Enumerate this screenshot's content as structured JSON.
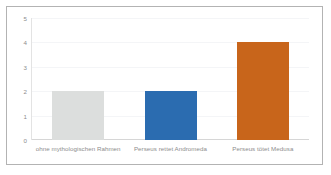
{
  "chart_data": {
    "type": "bar",
    "title": "",
    "subtitle": "",
    "xlabel": "",
    "ylabel": "",
    "categories": [
      "ohne mythologischen Rahmen",
      "Perseus rettet Andromeda",
      "Perseus tötet Medusa"
    ],
    "values": [
      2,
      2,
      4
    ],
    "bar_colors": [
      "#dcdedd",
      "#2b6cb0",
      "#c8651b"
    ],
    "ylim": [
      0,
      5
    ],
    "yticks": [
      "0",
      "1",
      "2",
      "3",
      "4",
      "5"
    ],
    "grid": true,
    "legend": "none"
  },
  "axis": {
    "tick_color": "#8d8d8d",
    "gridline_color": "#f4f5f7",
    "baseline_color": "#d6d6d6"
  },
  "frame": {
    "border_color": "#b3b3b3",
    "background": "#ffffff"
  }
}
